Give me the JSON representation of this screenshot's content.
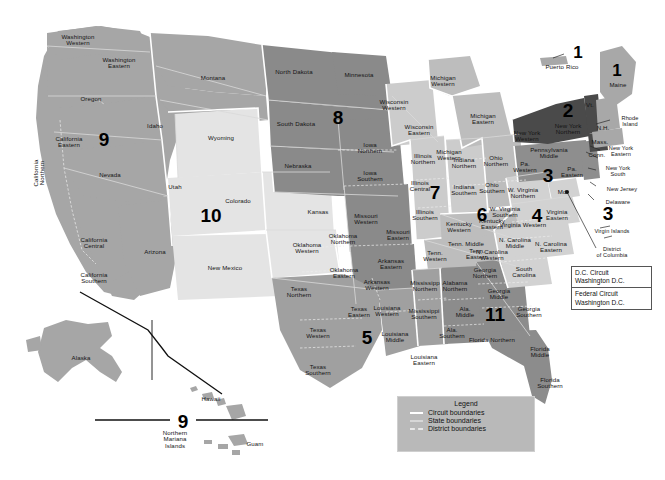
{
  "colors": {
    "background": "#ffffff",
    "circuit_1": "#a8a8a8",
    "circuit_2": "#4a4a4a",
    "circuit_3": "#8e8e8e",
    "circuit_4": "#d2d2d2",
    "circuit_5": "#a0a0a0",
    "circuit_6": "#bdbdbd",
    "circuit_7": "#cccccc",
    "circuit_8": "#8a8a8a",
    "circuit_9": "#a6a6a6",
    "circuit_10": "#e4e4e4",
    "circuit_11": "#8c8c8c",
    "outline": "#ffffff",
    "text": "#141414",
    "boundary_circuit": "#ffffff",
    "boundary_state": "#d7d7d7",
    "boundary_district": "#e8e8e8"
  },
  "legend": {
    "title": "Legend",
    "items": [
      {
        "label": "Circuit boundaries",
        "kind": "circuit"
      },
      {
        "label": "State boundaries",
        "kind": "state"
      },
      {
        "label": "District boundaries",
        "kind": "district"
      }
    ]
  },
  "special_courts": [
    {
      "name": "D.C. Circuit",
      "location": "Washington D.C."
    },
    {
      "name": "Federal Circuit",
      "location": "Washington D.C."
    }
  ],
  "circuit_numbers": [
    {
      "n": "1",
      "x": 578,
      "y": 52
    },
    {
      "n": "1",
      "x": 617,
      "y": 70
    },
    {
      "n": "2",
      "x": 568,
      "y": 110
    },
    {
      "n": "3",
      "x": 548,
      "y": 175
    },
    {
      "n": "3",
      "x": 608,
      "y": 213
    },
    {
      "n": "4",
      "x": 537,
      "y": 215
    },
    {
      "n": "5",
      "x": 367,
      "y": 337
    },
    {
      "n": "6",
      "x": 482,
      "y": 214
    },
    {
      "n": "7",
      "x": 435,
      "y": 192
    },
    {
      "n": "8",
      "x": 338,
      "y": 117
    },
    {
      "n": "9",
      "x": 104,
      "y": 139
    },
    {
      "n": "9",
      "x": 183,
      "y": 421
    },
    {
      "n": "10",
      "x": 211,
      "y": 215
    },
    {
      "n": "11",
      "x": 495,
      "y": 314
    }
  ],
  "district_labels": [
    {
      "text": "Washington\nWestern",
      "x": 78,
      "y": 40
    },
    {
      "text": "Washington\nEastern",
      "x": 119,
      "y": 63
    },
    {
      "text": "Oregon",
      "x": 91,
      "y": 99
    },
    {
      "text": "Idaho",
      "x": 155,
      "y": 126
    },
    {
      "text": "Montana",
      "x": 213,
      "y": 78
    },
    {
      "text": "Wyoming",
      "x": 221,
      "y": 138
    },
    {
      "text": "Nevada",
      "x": 110,
      "y": 175
    },
    {
      "text": "Utah",
      "x": 175,
      "y": 187
    },
    {
      "text": "Colorado",
      "x": 238,
      "y": 201
    },
    {
      "text": "Arizona",
      "x": 155,
      "y": 252
    },
    {
      "text": "New Mexico",
      "x": 225,
      "y": 268
    },
    {
      "text": "California\nEastern",
      "x": 69,
      "y": 142
    },
    {
      "text": "California\nNorthern",
      "x": 39,
      "y": 173,
      "rotate": true
    },
    {
      "text": "California\nCentral",
      "x": 94,
      "y": 243
    },
    {
      "text": "California\nSouthern",
      "x": 94,
      "y": 278
    },
    {
      "text": "North Dakota",
      "x": 294,
      "y": 72
    },
    {
      "text": "South Dakota",
      "x": 296,
      "y": 124
    },
    {
      "text": "Nebraska",
      "x": 298,
      "y": 166
    },
    {
      "text": "Minnesota",
      "x": 359,
      "y": 75
    },
    {
      "text": "Kansas",
      "x": 318,
      "y": 212
    },
    {
      "text": "Iowa\nNorthern",
      "x": 370,
      "y": 148
    },
    {
      "text": "Iowa\nSouthern",
      "x": 370,
      "y": 176
    },
    {
      "text": "Missouri\nWestern",
      "x": 366,
      "y": 219
    },
    {
      "text": "Missouri\nEastern",
      "x": 398,
      "y": 235
    },
    {
      "text": "Oklahoma\nNorthern",
      "x": 343,
      "y": 239
    },
    {
      "text": "Oklahoma\nWestern",
      "x": 307,
      "y": 248
    },
    {
      "text": "Oklahoma\nEastern",
      "x": 344,
      "y": 273
    },
    {
      "text": "Arkansas\nEastern",
      "x": 391,
      "y": 264
    },
    {
      "text": "Arkansas\nWestern",
      "x": 377,
      "y": 285
    },
    {
      "text": "Texas\nNorthern",
      "x": 299,
      "y": 292
    },
    {
      "text": "Texas\nWestern",
      "x": 318,
      "y": 333
    },
    {
      "text": "Texas\nSouthern",
      "x": 318,
      "y": 370
    },
    {
      "text": "Texas\nEastern",
      "x": 359,
      "y": 312
    },
    {
      "text": "Louisiana\nWestern",
      "x": 387,
      "y": 311
    },
    {
      "text": "Louisiana\nMiddle",
      "x": 395,
      "y": 337
    },
    {
      "text": "Louisiana\nEastern",
      "x": 424,
      "y": 360
    },
    {
      "text": "Mississipp\nNorthern",
      "x": 425,
      "y": 286
    },
    {
      "text": "Mississippi\nSouthern",
      "x": 424,
      "y": 314
    },
    {
      "text": "Wisconsin\nWestern",
      "x": 394,
      "y": 105
    },
    {
      "text": "Wisconsin\nEastern",
      "x": 419,
      "y": 130
    },
    {
      "text": "Michigan\nWestern",
      "x": 443,
      "y": 81
    },
    {
      "text": "Michigan\nEastern",
      "x": 483,
      "y": 119
    },
    {
      "text": "Michigan\nWestern",
      "x": 449,
      "y": 155
    },
    {
      "text": "Illinois\nNorthern",
      "x": 423,
      "y": 159
    },
    {
      "text": "Illinois\nCentral",
      "x": 420,
      "y": 186
    },
    {
      "text": "Illinois\nSouthern",
      "x": 425,
      "y": 215
    },
    {
      "text": "Indiana\nNorthern",
      "x": 464,
      "y": 163
    },
    {
      "text": "Indiana\nSouthern",
      "x": 464,
      "y": 190
    },
    {
      "text": "Ohio\nNorthern",
      "x": 496,
      "y": 161
    },
    {
      "text": "Ohio\nSouthern",
      "x": 492,
      "y": 188
    },
    {
      "text": "Kentucky\nWestern",
      "x": 459,
      "y": 227
    },
    {
      "text": "Kentucky\nEastern",
      "x": 492,
      "y": 224
    },
    {
      "text": "Tenn. Middle",
      "x": 466,
      "y": 244
    },
    {
      "text": "Tenn.\nWestern",
      "x": 435,
      "y": 256
    },
    {
      "text": "Tenn.\nEastern",
      "x": 477,
      "y": 254
    },
    {
      "text": "Alabama\nNorthern",
      "x": 455,
      "y": 286
    },
    {
      "text": "Ala.\nMiddle",
      "x": 465,
      "y": 312
    },
    {
      "text": "Ala.\nSouthern",
      "x": 452,
      "y": 333
    },
    {
      "text": "Georgia\nNorthern",
      "x": 485,
      "y": 273
    },
    {
      "text": "Georgia\nMiddle",
      "x": 499,
      "y": 294
    },
    {
      "text": "Georgia\nSouthern",
      "x": 529,
      "y": 312
    },
    {
      "text": "Florida Northern",
      "x": 492,
      "y": 340
    },
    {
      "text": "Florida\nMiddle",
      "x": 540,
      "y": 352
    },
    {
      "text": "Florida\nSouthern",
      "x": 550,
      "y": 383
    },
    {
      "text": "South\nCarolina",
      "x": 524,
      "y": 272
    },
    {
      "text": "N. Carolina\nMiddle",
      "x": 515,
      "y": 243
    },
    {
      "text": "N. Carolina\nWestern",
      "x": 492,
      "y": 255
    },
    {
      "text": "N. Carolina\nEastern",
      "x": 551,
      "y": 247
    },
    {
      "text": "Virginia Western",
      "x": 523,
      "y": 225
    },
    {
      "text": "Virginia\nEastern",
      "x": 557,
      "y": 215
    },
    {
      "text": "W. Virginia\nNorthern",
      "x": 523,
      "y": 193
    },
    {
      "text": "W. Virginia\nSouthern",
      "x": 505,
      "y": 212
    },
    {
      "text": "Pennsylvania\nMiddle",
      "x": 549,
      "y": 153
    },
    {
      "text": "Pa.\nWestern",
      "x": 525,
      "y": 167
    },
    {
      "text": "Pa.\nEastern",
      "x": 572,
      "y": 172
    },
    {
      "text": "New York\nWestern",
      "x": 527,
      "y": 136
    },
    {
      "text": "New York\nNorthern",
      "x": 568,
      "y": 129
    },
    {
      "text": "Maine",
      "x": 618,
      "y": 85
    },
    {
      "text": "Vt.",
      "x": 590,
      "y": 105
    },
    {
      "text": "N.H.",
      "x": 603,
      "y": 128
    },
    {
      "text": "Mass.",
      "x": 600,
      "y": 142
    },
    {
      "text": "Conn.",
      "x": 597,
      "y": 155
    },
    {
      "text": "Md.",
      "x": 563,
      "y": 192
    },
    {
      "text": "Puerto Rico",
      "x": 562,
      "y": 67
    },
    {
      "text": "Alaska",
      "x": 81,
      "y": 358
    },
    {
      "text": "Hawaii",
      "x": 211,
      "y": 399
    },
    {
      "text": "Guam",
      "x": 255,
      "y": 444
    },
    {
      "text": "Northern\nMariana\nIslands",
      "x": 175,
      "y": 440
    }
  ],
  "callout_labels": [
    {
      "text": "Rhode\nIsland",
      "x": 630,
      "y": 122
    },
    {
      "text": "New York\nEastern",
      "x": 621,
      "y": 152
    },
    {
      "text": "New York\nSouth",
      "x": 618,
      "y": 172
    },
    {
      "text": "New Jersey",
      "x": 622,
      "y": 190
    },
    {
      "text": "Delaware",
      "x": 618,
      "y": 203
    },
    {
      "text": "Virgin Islands",
      "x": 612,
      "y": 232
    },
    {
      "text": "District\nof Columbia",
      "x": 612,
      "y": 253
    }
  ]
}
